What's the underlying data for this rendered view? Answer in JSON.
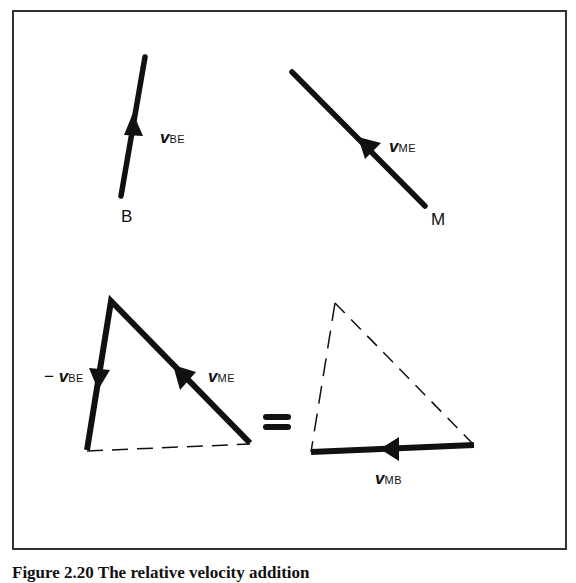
{
  "figure": {
    "caption": "Figure 2.20 The relative velocity addition",
    "top_left": {
      "vector_label": "v",
      "vector_sub": "BE",
      "point_label": "B"
    },
    "top_right": {
      "vector_label": "v",
      "vector_sub": "ME",
      "point_label": "M"
    },
    "bottom_left_triangle": {
      "left_side_label_prefix": "−",
      "left_side_label": "v",
      "left_side_sub": "BE",
      "right_side_label": "v",
      "right_side_sub": "ME"
    },
    "equals_symbol": "=",
    "bottom_right_triangle": {
      "base_label": "v",
      "base_sub": "MB"
    },
    "colors": {
      "ink": "#111111",
      "frame": "#333333",
      "background": "#ffffff"
    }
  }
}
